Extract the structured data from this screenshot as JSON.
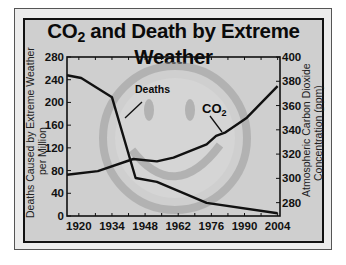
{
  "chart_data": {
    "type": "line",
    "title": "CO2 and Death by Extreme Weather",
    "xlabel": "",
    "ylabel": "Deaths Caused by Extreme Weather per Million",
    "ylabel_right": "Atmospheric Carbon Dioxide Concentration (ppm)",
    "x_ticks": [
      "1920",
      "1934",
      "1948",
      "1962",
      "1976",
      "1990",
      "2004"
    ],
    "y_left_ticks": [
      "0",
      "40",
      "80",
      "120",
      "160",
      "200",
      "240",
      "280"
    ],
    "y_right_ticks": [
      "280",
      "300",
      "320",
      "340",
      "360",
      "380",
      "400"
    ],
    "ylim_left": [
      0,
      280
    ],
    "ylim_right": [
      269,
      400
    ],
    "xlim": [
      1915,
      2005
    ],
    "grid": false,
    "legend": "inline annotations",
    "series": [
      {
        "name": "Deaths",
        "axis": "left",
        "x": [
          1915,
          1921,
          1934,
          1944,
          1953,
          1974,
          2004
        ],
        "values": [
          248,
          243,
          209,
          67,
          60,
          23,
          5
        ]
      },
      {
        "name": "CO2",
        "axis": "right",
        "x": [
          1915,
          1928,
          1943,
          1953,
          1960,
          1974,
          1978,
          1982,
          1991,
          2004
        ],
        "values": [
          303,
          306,
          316,
          314,
          317,
          328,
          335,
          338,
          350,
          376
        ]
      }
    ],
    "annotations": [
      "Deaths",
      "CO2"
    ]
  },
  "title": {
    "main_before": "CO",
    "subscript": "2",
    "main_after": " and Death by Extreme Weather"
  },
  "axes": {
    "left_title_line1": "Deaths Caused by Extreme Weather",
    "left_title_line2": "per Million",
    "right_title_line1": "Atmospheric Carbon Dioxide",
    "right_title_line2": "Concentration (ppm)"
  },
  "labels": {
    "deaths": "Deaths",
    "co2_main": "CO",
    "co2_sub": "2"
  },
  "colors": {
    "line": "#111111",
    "panel_bg": "#cfcfcf",
    "smiley": "#a9a9a9"
  }
}
